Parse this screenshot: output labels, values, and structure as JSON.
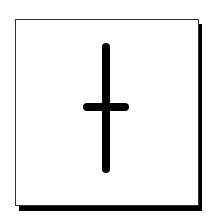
{
  "card": {
    "background": "#ffffff",
    "border_color": "#333333",
    "shadow_color": "#000000"
  },
  "symbol": {
    "name": "dagger-cross",
    "color": "#000000",
    "vertical": {
      "x": 106,
      "y1": 47,
      "y2": 169
    },
    "horizontal": {
      "y": 107,
      "x1": 87,
      "x2": 125
    },
    "stroke_width": 8
  }
}
